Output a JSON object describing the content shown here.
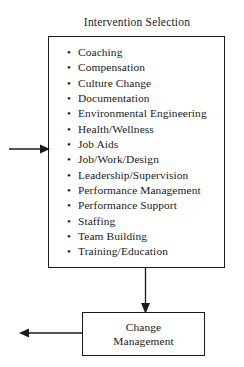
{
  "diagram": {
    "title": "Intervention Selection",
    "intervention_box": {
      "bullet_glyph": "•",
      "items": [
        "Coaching",
        "Compensation",
        "Culture Change",
        "Documentation",
        "Environmental Engineering",
        "Health/Wellness",
        "Job Aids",
        "Job/Work/Design",
        "Leadership/Supervision",
        "Performance Management",
        "Performance Support",
        "Staffing",
        "Team Building",
        "Training/Education"
      ]
    },
    "change_box": {
      "line1": "Change",
      "line2": "Management"
    },
    "connectors": {
      "incoming_arrow": "arrow-right-into-intervention-box",
      "down_arrow": "arrow-down-to-change-management",
      "outgoing_arrow": "arrow-left-out-of-change-management"
    },
    "colors": {
      "stroke": "#1a1a1a",
      "background": "#ffffff"
    }
  }
}
